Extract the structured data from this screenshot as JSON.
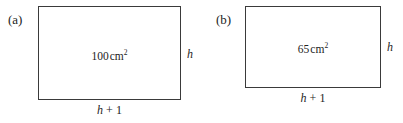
{
  "figures": [
    {
      "id": "a",
      "label": "(a)",
      "area_value": "100",
      "area_unit": "cm",
      "area_exponent": "2",
      "height_label": "h",
      "base_label_prefix": "h",
      "base_label_suffix": " + 1",
      "stroke_color": "#3a3a3a",
      "text_color": "#232323"
    },
    {
      "id": "b",
      "label": "(b)",
      "area_value": "65",
      "area_unit": "cm",
      "area_exponent": "2",
      "height_label": "h",
      "base_label_prefix": "h",
      "base_label_suffix": " + 1",
      "stroke_color": "#3a3a3a",
      "text_color": "#232323"
    }
  ],
  "page": {
    "background": "#ffffff"
  }
}
